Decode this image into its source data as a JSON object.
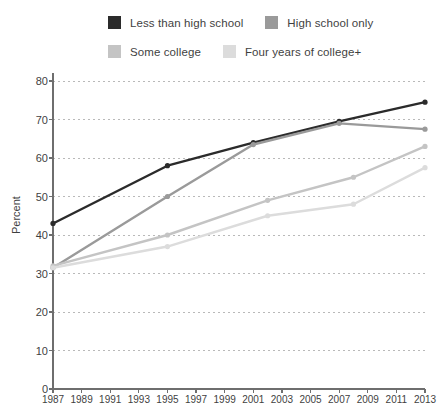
{
  "chart_data": {
    "type": "line",
    "title": "",
    "subtitle": "",
    "xlabel": "",
    "ylabel": "Percent",
    "xlim": [
      1987,
      2013
    ],
    "ylim": [
      0,
      80
    ],
    "grid": true,
    "legend_position": "top",
    "x_tick_labels": [
      "1987",
      "1989",
      "1991",
      "1993",
      "1995",
      "1997",
      "1999",
      "2001",
      "2003",
      "2005",
      "2007",
      "2009",
      "2011",
      "2013"
    ],
    "x_ticks": [
      1987,
      1989,
      1991,
      1993,
      1995,
      1997,
      1999,
      2001,
      2003,
      2005,
      2007,
      2009,
      2011,
      2013
    ],
    "y_tick_labels": [
      "0",
      "10",
      "20",
      "30",
      "40",
      "50",
      "60",
      "70",
      "80"
    ],
    "y_ticks": [
      0,
      10,
      20,
      30,
      40,
      50,
      60,
      70,
      80
    ],
    "series": [
      {
        "name": "Less than high school",
        "color": "#2b2b2b",
        "x": [
          1987,
          1995,
          2001,
          2007,
          2013
        ],
        "values": [
          43,
          58,
          64,
          69.5,
          74.5
        ]
      },
      {
        "name": "High school only",
        "color": "#9a9a9a",
        "x": [
          1987,
          1995,
          2001,
          2007,
          2013
        ],
        "values": [
          31.5,
          50,
          63.5,
          69,
          67.5
        ]
      },
      {
        "name": "Some college",
        "color": "#c4c4c4",
        "x": [
          1987,
          1995,
          2002,
          2008,
          2013
        ],
        "values": [
          32,
          40,
          49,
          55,
          63
        ]
      },
      {
        "name": "Four years of college+",
        "color": "#dcdcdc",
        "x": [
          1987,
          1995,
          2002,
          2008,
          2013
        ],
        "values": [
          31.5,
          37,
          45,
          48,
          57.5
        ]
      }
    ]
  },
  "legend": {
    "rows": [
      [
        {
          "label": "Less than high school",
          "color": "#2b2b2b"
        },
        {
          "label": "High school only",
          "color": "#9a9a9a"
        }
      ],
      [
        {
          "label": "Some college",
          "color": "#c4c4c4"
        },
        {
          "label": "Four years of college+",
          "color": "#dcdcdc"
        }
      ]
    ]
  },
  "colors": {
    "axis": "#6e6e6e",
    "grid": "#b9b9b9",
    "text": "#3f3f3f",
    "background": "#ffffff"
  }
}
